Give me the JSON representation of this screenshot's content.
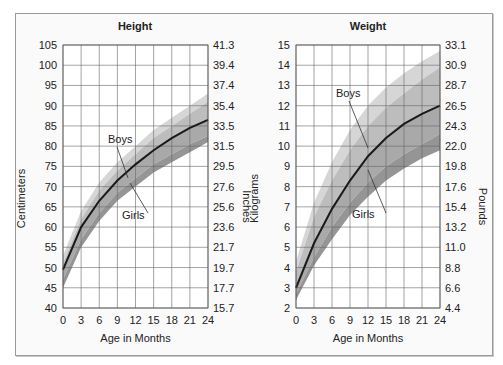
{
  "chart_data": [
    {
      "type": "area",
      "title": "Height",
      "xlabel": "Age in Months",
      "ylabel": "Centimeters",
      "ylabel_right": "Inches",
      "x_ticks": [
        0,
        3,
        6,
        9,
        12,
        15,
        18,
        21,
        24
      ],
      "y_ticks": [
        40,
        45,
        50,
        55,
        60,
        65,
        70,
        75,
        80,
        85,
        90,
        95,
        100,
        105
      ],
      "y_ticks_right": [
        "15.7",
        "17.7",
        "19.7",
        "21.7",
        "23.6",
        "25.6",
        "27.6",
        "29.5",
        "31.5",
        "33.5",
        "35.4",
        "37.4",
        "39.4",
        "41.3"
      ],
      "ylim": [
        40,
        105
      ],
      "xlim": [
        0,
        24
      ],
      "grid": true,
      "annotations": [
        "Boys",
        "Girls"
      ],
      "x": [
        0,
        3,
        6,
        9,
        12,
        15,
        18,
        21,
        24
      ],
      "series": [
        {
          "name": "Upper band (Boys high)",
          "values": [
            53,
            64,
            71,
            76,
            80,
            84,
            87,
            90,
            93
          ]
        },
        {
          "name": "Boys band upper",
          "values": [
            51,
            62,
            69,
            74,
            78,
            82,
            85,
            88,
            91
          ]
        },
        {
          "name": "Median",
          "values": [
            49.5,
            60,
            66.5,
            71.5,
            75.5,
            79,
            82,
            84.5,
            86.5
          ]
        },
        {
          "name": "Girls band lower",
          "values": [
            47,
            57,
            63.5,
            68.5,
            72,
            75.5,
            78,
            80.5,
            82.5
          ]
        },
        {
          "name": "Lower band (Girls low)",
          "values": [
            45,
            55,
            61.5,
            66.5,
            70,
            73.5,
            76,
            78.5,
            81
          ]
        }
      ]
    },
    {
      "type": "area",
      "title": "Weight",
      "xlabel": "Age in Months",
      "ylabel": "Kilograms",
      "ylabel_right": "Pounds",
      "x_ticks": [
        0,
        3,
        6,
        9,
        12,
        15,
        18,
        21,
        24
      ],
      "y_ticks": [
        2,
        3,
        4,
        5,
        6,
        7,
        8,
        9,
        10,
        11,
        12,
        13,
        14,
        15
      ],
      "y_ticks_right": [
        "4.4",
        "6.6",
        "8.8",
        "11.0",
        "13.2",
        "15.4",
        "17.6",
        "19.8",
        "22.0",
        "24.3",
        "26.5",
        "28.7",
        "30.9",
        "33.1"
      ],
      "ylim": [
        2,
        15
      ],
      "xlim": [
        0,
        24
      ],
      "grid": true,
      "annotations": [
        "Boys",
        "Girls"
      ],
      "x": [
        0,
        3,
        6,
        9,
        12,
        15,
        18,
        21,
        24
      ],
      "series": [
        {
          "name": "Upper band (Boys high)",
          "values": [
            4.3,
            7.2,
            9.2,
            10.8,
            12.0,
            12.9,
            13.6,
            14.2,
            14.7
          ]
        },
        {
          "name": "Boys band upper",
          "values": [
            3.8,
            6.5,
            8.3,
            9.8,
            11.0,
            11.9,
            12.6,
            13.3,
            13.9
          ]
        },
        {
          "name": "Median",
          "values": [
            3.0,
            5.2,
            6.9,
            8.3,
            9.5,
            10.4,
            11.1,
            11.6,
            12.0
          ]
        },
        {
          "name": "Girls band lower",
          "values": [
            2.7,
            4.5,
            6.0,
            7.2,
            8.2,
            9.0,
            9.6,
            10.1,
            10.6
          ]
        },
        {
          "name": "Lower band (Girls low)",
          "values": [
            2.4,
            4.1,
            5.4,
            6.6,
            7.5,
            8.3,
            8.9,
            9.4,
            9.8
          ]
        }
      ]
    }
  ],
  "labels": {
    "height_title": "Height",
    "weight_title": "Weight",
    "x_axis": "Age in Months",
    "cm": "Centimeters",
    "inches": "Inches",
    "kg": "Kilograms",
    "lb": "Pounds",
    "boys": "Boys",
    "girls": "Girls"
  }
}
